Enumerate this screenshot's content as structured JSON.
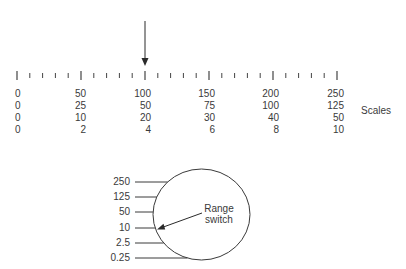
{
  "figure": {
    "type": "meter-scale-and-range-switch",
    "pointer": {
      "label": "pointer-arrow",
      "points_to_value": 100
    },
    "ruler": {
      "range": [
        0,
        250
      ],
      "major_tick_every": 50,
      "minor_tick_every": 10
    },
    "scales": {
      "label": "Scales",
      "rows": [
        [
          "0",
          "50",
          "100",
          "150",
          "200",
          "250"
        ],
        [
          "0",
          "25",
          "50",
          "75",
          "100",
          "125"
        ],
        [
          "0",
          "10",
          "20",
          "30",
          "40",
          "50"
        ],
        [
          "0",
          "2",
          "4",
          "6",
          "8",
          "10"
        ]
      ]
    },
    "range_switch": {
      "label_line1": "Range",
      "label_line2": "switch",
      "positions": [
        "250",
        "125",
        "50",
        "10",
        "2.5",
        "0.25"
      ],
      "selected": "10"
    }
  },
  "chart_data": {
    "type": "diagram",
    "title": "",
    "scale_rows": [
      [
        0,
        50,
        100,
        150,
        200,
        250
      ],
      [
        0,
        25,
        50,
        75,
        100,
        125
      ],
      [
        0,
        10,
        20,
        30,
        40,
        50
      ],
      [
        0,
        2,
        4,
        6,
        8,
        10
      ]
    ],
    "pointer_position": 100,
    "range_switch_positions": [
      250,
      125,
      50,
      10,
      2.5,
      0.25
    ],
    "range_switch_selected": 10,
    "annotations": [
      "Scales",
      "Range switch"
    ]
  },
  "colors": {
    "ink": "#3a3a3a",
    "background": "#ffffff"
  }
}
